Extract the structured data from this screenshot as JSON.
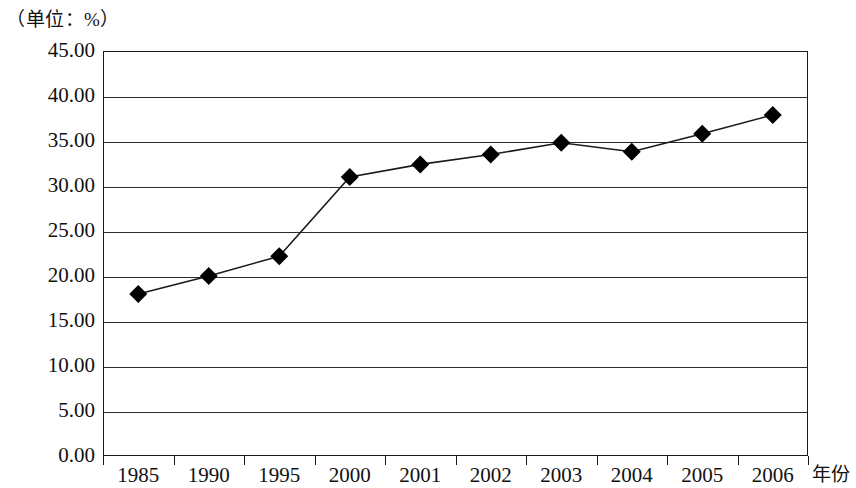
{
  "caption": {
    "unit_label": "（单位：%）"
  },
  "chart_data": {
    "type": "line",
    "title": "",
    "subtitle": "",
    "unit_note": "（单位：%）",
    "xlabel": "年份",
    "ylabel": "",
    "categories": [
      "1985",
      "1990",
      "1995",
      "2000",
      "2001",
      "2002",
      "2003",
      "2004",
      "2005",
      "2006"
    ],
    "values": [
      18.0,
      20.0,
      22.2,
      31.0,
      32.4,
      33.5,
      34.8,
      33.8,
      35.8,
      37.9
    ],
    "series": [
      {
        "name": "",
        "values": [
          18.0,
          20.0,
          22.2,
          31.0,
          32.4,
          33.5,
          34.8,
          33.8,
          35.8,
          37.9
        ],
        "marker": "diamond",
        "marker_color": "#000000",
        "line_color": "#1a1a1a"
      }
    ],
    "ylim": [
      0.0,
      45.0
    ],
    "ytick_step": 5.0,
    "ytick_labels": [
      "45.00",
      "40.00",
      "35.00",
      "30.00",
      "25.00",
      "20.00",
      "15.00",
      "10.00",
      "5.00",
      "0.00"
    ],
    "ytick_values": [
      45.0,
      40.0,
      35.0,
      30.0,
      25.0,
      20.0,
      15.0,
      10.0,
      5.0,
      0.0
    ],
    "grid": true,
    "grid_axis": "y",
    "legend": false,
    "legend_position": "none",
    "plot_background": "#ffffff",
    "axis_color": "#1a1a1a"
  }
}
